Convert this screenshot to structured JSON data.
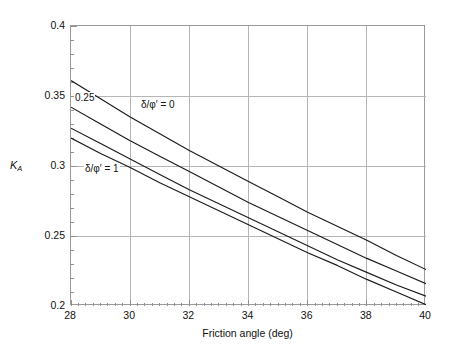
{
  "chart_data": {
    "type": "line",
    "title": "",
    "xlabel": "Friction angle (deg)",
    "ylabel": "K_A",
    "ylabel_base": "K",
    "ylabel_sub": "A",
    "xlim": [
      28,
      40
    ],
    "ylim": [
      0.2,
      0.4
    ],
    "xticks": [
      28,
      30,
      32,
      34,
      36,
      38,
      40
    ],
    "xtick_labels": [
      "28",
      "30",
      "32",
      "34",
      "36",
      "38",
      "40"
    ],
    "yticks": [
      0.2,
      0.25,
      0.3,
      0.35,
      0.4
    ],
    "ytick_labels": [
      "0.2",
      "0.25",
      "0.3",
      "0.35",
      "0.4"
    ],
    "x_minor_step": 0.25,
    "y_minor_step": 0.01,
    "grid": true,
    "grid_color": "#b5b5b5",
    "axis_color": "#8f8f8f",
    "line_color": "#1a1a1a",
    "legend_position": "in-plot-annotations",
    "x": [
      28,
      29,
      30,
      31,
      32,
      33,
      34,
      35,
      36,
      37,
      38,
      39,
      40
    ],
    "series": [
      {
        "name": "delta/phi' = 0",
        "label": "δ/φ′ = 0",
        "values": [
          0.361,
          0.348,
          0.335,
          0.323,
          0.311,
          0.3,
          0.289,
          0.278,
          0.267,
          0.257,
          0.247,
          0.236,
          0.226
        ]
      },
      {
        "name": "delta/phi' = 0.25",
        "label": "0.25",
        "values": [
          0.342,
          0.33,
          0.318,
          0.307,
          0.296,
          0.285,
          0.274,
          0.264,
          0.254,
          0.244,
          0.234,
          0.225,
          0.216
        ]
      },
      {
        "name": "delta/phi' = 0.5",
        "label": "",
        "values": [
          0.327,
          0.316,
          0.305,
          0.294,
          0.283,
          0.273,
          0.263,
          0.253,
          0.243,
          0.233,
          0.224,
          0.215,
          0.207
        ]
      },
      {
        "name": "delta/phi' = 1",
        "label": "δ/φ′ = 1",
        "values": [
          0.32,
          0.309,
          0.299,
          0.288,
          0.278,
          0.268,
          0.258,
          0.248,
          0.238,
          0.229,
          0.219,
          0.21,
          0.201
        ]
      }
    ],
    "annotations": [
      {
        "id": "annot-025",
        "text": "0.25"
      },
      {
        "id": "annot-d0",
        "text": "δ/φ′ = 0"
      },
      {
        "id": "annot-d1",
        "text": "δ/φ′ = 1"
      }
    ]
  }
}
